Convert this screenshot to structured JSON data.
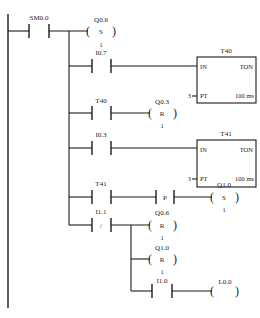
{
  "diagram": {
    "type": "ladder",
    "rungs": [
      {
        "contact": {
          "address": "SM0.0",
          "type": "NO"
        },
        "outputs": [
          {
            "kind": "coil",
            "address": "Q0.6",
            "op": "S",
            "n": "1"
          }
        ]
      },
      {
        "contact": {
          "address": "I0.7",
          "type": "NO"
        },
        "outputs": [
          {
            "kind": "timer",
            "name": "T40",
            "type": "TON",
            "in": "IN",
            "pt_label": "PT",
            "pt_value": "3",
            "base": "100 ms"
          }
        ]
      },
      {
        "contact": {
          "address": "T40",
          "type": "NO"
        },
        "outputs": [
          {
            "kind": "coil",
            "address": "Q0.3",
            "op": "R",
            "n": "1"
          }
        ]
      },
      {
        "contact": {
          "address": "I0.3",
          "type": "NO"
        },
        "outputs": [
          {
            "kind": "timer",
            "name": "T41",
            "type": "TON",
            "in": "IN",
            "pt_label": "PT",
            "pt_value": "3",
            "base": "100 ms"
          }
        ]
      },
      {
        "contact": {
          "address": "T41",
          "type": "NO"
        },
        "edge": "P",
        "outputs": [
          {
            "kind": "coil",
            "address": "Q1.0",
            "op": "S",
            "n": "1"
          }
        ]
      },
      {
        "contact": {
          "address": "I1.1",
          "type": "NC",
          "symbol": "/"
        },
        "outputs": [
          {
            "kind": "coil",
            "address": "Q0.6",
            "op": "R",
            "n": "1"
          },
          {
            "kind": "coil",
            "address": "Q1.0",
            "op": "R",
            "n": "1"
          },
          {
            "kind": "contact+coil",
            "contact": "I1.0",
            "coil": "L0.0"
          }
        ]
      }
    ]
  },
  "labels": {
    "sm00": "SM0.0",
    "q06": "Q0.6",
    "s": "S",
    "r": "R",
    "one": "1",
    "i07": "I0.7",
    "t40": "T40",
    "t41": "T41",
    "in": "IN",
    "ton": "TON",
    "pt": "PT",
    "three": "3",
    "ms": "100 ms",
    "q03": "Q0.3",
    "i03": "I0.3",
    "p": "P",
    "q10": "Q1.0",
    "i11": "I1.1",
    "slash": "/",
    "i10": "I1.0",
    "l00": "L0.0"
  }
}
